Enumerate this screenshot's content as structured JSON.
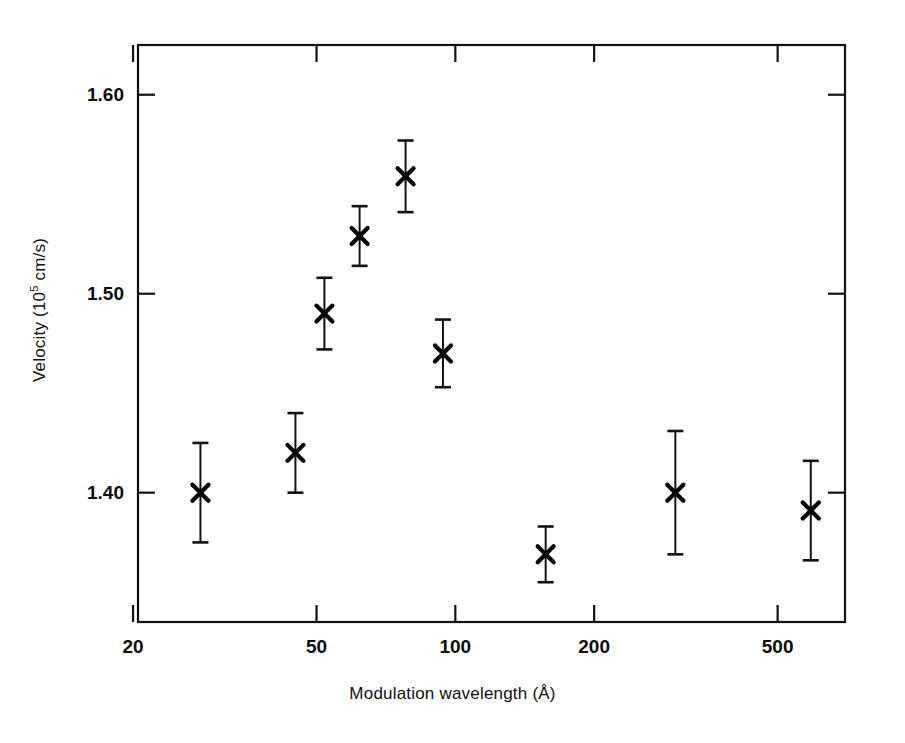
{
  "chart_data": {
    "type": "scatter",
    "title": "",
    "xlabel": "Modulation wavelength (Å)",
    "xlabel_parts": {
      "text": "Modulation wavelength (Å)"
    },
    "ylabel": "Velocity (10^5 cm/s)",
    "ylabel_parts": {
      "prefix": "Velocity (10",
      "exponent": "5",
      "suffix": " cm/s)"
    },
    "xscale": "log",
    "yscale": "linear",
    "xlim": [
      20.5,
      700
    ],
    "ylim": [
      1.335,
      1.625
    ],
    "grid": false,
    "legend": null,
    "marker": "x",
    "errorbars": true,
    "xticks": [
      20,
      50,
      100,
      200,
      500
    ],
    "xtick_labels": [
      "20",
      "50",
      "100",
      "200",
      "500"
    ],
    "yticks": [
      1.4,
      1.5,
      1.6
    ],
    "ytick_labels": [
      "1.40",
      "1.50",
      "1.60"
    ],
    "series": [
      {
        "name": "velocity",
        "x": [
          28,
          45,
          52,
          62,
          78,
          94,
          157,
          300,
          590
        ],
        "y": [
          1.4,
          1.42,
          1.49,
          1.529,
          1.559,
          1.47,
          1.369,
          1.4,
          1.391
        ],
        "yerr": [
          0.025,
          0.02,
          0.018,
          0.015,
          0.018,
          0.017,
          0.014,
          0.031,
          0.025
        ]
      }
    ],
    "point_labels": [
      "28 Å, 1.400",
      "45 Å, 1.420",
      "52 Å, 1.490",
      "62 Å, 1.529",
      "78 Å, 1.559",
      "94 Å, 1.470",
      "157 Å, 1.369",
      "300 Å, 1.400",
      "590 Å, 1.391"
    ],
    "colors": {
      "axis": "#111111",
      "marker": "#000000",
      "errorbar": "#111111",
      "background": "#ffffff"
    }
  }
}
